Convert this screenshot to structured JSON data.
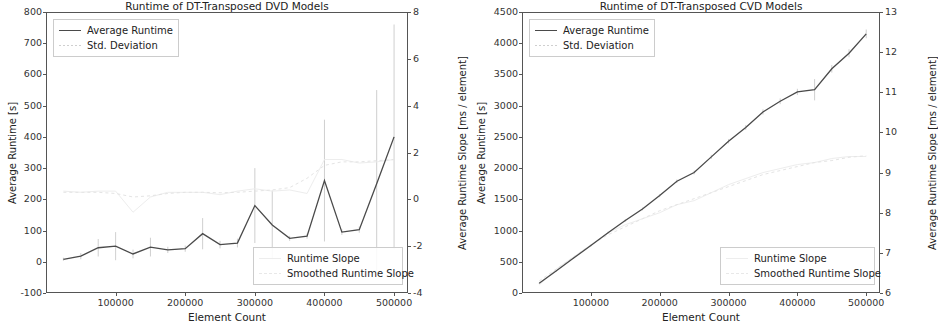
{
  "figure": {
    "panels": [
      {
        "id": "dvd",
        "title": "Runtime of DT-Transposed DVD Models",
        "xlabel": "Element Count",
        "ylabel_left": "Average Runtime [s]",
        "ylabel_right": "Average Runtime Slope [ms / element]",
        "yticks_left": [
          "800",
          "700",
          "600",
          "500",
          "400",
          "300",
          "200",
          "100",
          "0",
          "-100"
        ],
        "yticks_right": [
          "8",
          "6",
          "4",
          "2",
          "0",
          "-2",
          "-4"
        ],
        "xticks": [
          "100000",
          "200000",
          "300000",
          "400000",
          "500000"
        ],
        "legend_top": [
          {
            "label": "Average Runtime",
            "key": "line"
          },
          {
            "label": "Std. Deviation",
            "key": "dot"
          }
        ],
        "legend_bottom": [
          {
            "label": "Runtime Slope",
            "key": "faint1"
          },
          {
            "label": "Smoothed Runtime Slope",
            "key": "faint2"
          }
        ]
      },
      {
        "id": "cvd",
        "title": "Runtime of DT-Transposed CVD Models",
        "xlabel": "Element Count",
        "ylabel_left": "Average Runtime [s]",
        "ylabel_right": "Average Runtime Slope [ms / element]",
        "yticks_left": [
          "4500",
          "4000",
          "3500",
          "3000",
          "2500",
          "2000",
          "1500",
          "1000",
          "500",
          "0"
        ],
        "yticks_right": [
          "13",
          "12",
          "11",
          "10",
          "9",
          "8",
          "7",
          "6"
        ],
        "xticks": [
          "100000",
          "200000",
          "300000",
          "400000",
          "500000"
        ],
        "legend_top": [
          {
            "label": "Average Runtime",
            "key": "line"
          },
          {
            "label": "Std. Deviation",
            "key": "dot"
          }
        ],
        "legend_bottom": [
          {
            "label": "Runtime Slope",
            "key": "faint1"
          },
          {
            "label": "Smoothed Runtime Slope",
            "key": "faint2"
          }
        ]
      }
    ]
  },
  "colors": {
    "runtime_line": "#4a4a4a",
    "std_deviation": "#c9c9c9",
    "slope": "#ededed",
    "smoothed_slope": "#e4e4e4",
    "frame": "#555555",
    "text": "#222222"
  },
  "chart_data": [
    {
      "type": "line",
      "id": "dvd",
      "title": "Runtime of DT-Transposed DVD Models",
      "xlabel": "Element Count",
      "ylabel": "Average Runtime [s]",
      "y2label": "Average Runtime Slope [ms / element]",
      "xlim": [
        0,
        520000
      ],
      "ylim": [
        -100,
        800
      ],
      "y2lim": [
        -4,
        8
      ],
      "xticks": [
        100000,
        200000,
        300000,
        400000,
        500000
      ],
      "yticks": [
        -100,
        0,
        100,
        200,
        300,
        400,
        500,
        600,
        700,
        800
      ],
      "y2ticks": [
        -4,
        -2,
        0,
        2,
        4,
        6,
        8
      ],
      "grid": false,
      "legend_position": [
        "upper left",
        "lower right"
      ],
      "x": [
        25000,
        50000,
        75000,
        100000,
        125000,
        150000,
        175000,
        200000,
        225000,
        250000,
        275000,
        300000,
        325000,
        350000,
        375000,
        400000,
        425000,
        450000,
        475000,
        500000
      ],
      "series": [
        {
          "name": "Average Runtime",
          "values": [
            8,
            18,
            45,
            50,
            25,
            47,
            38,
            42,
            90,
            55,
            60,
            180,
            118,
            75,
            82,
            260,
            95,
            103,
            250,
            400
          ],
          "errors": [
            5,
            10,
            28,
            45,
            14,
            30,
            10,
            10,
            50,
            12,
            14,
            120,
            110,
            8,
            8,
            195,
            9,
            10,
            300,
            360
          ]
        },
        {
          "name": "Runtime Slope",
          "values_y2": [
            0.35,
            0.3,
            0.35,
            0.35,
            -0.55,
            0.1,
            0.3,
            0.3,
            0.3,
            0.2,
            0.35,
            0.45,
            0.35,
            0.4,
            0.25,
            1.7,
            1.7,
            1.55,
            1.6,
            1.7
          ]
        },
        {
          "name": "Smoothed Runtime Slope",
          "values_y2": [
            0.3,
            0.3,
            0.3,
            0.25,
            0.1,
            0.15,
            0.25,
            0.3,
            0.3,
            0.28,
            0.3,
            0.35,
            0.4,
            0.5,
            0.9,
            1.45,
            1.6,
            1.6,
            1.65,
            1.7
          ]
        }
      ]
    },
    {
      "type": "line",
      "id": "cvd",
      "title": "Runtime of DT-Transposed CVD Models",
      "xlabel": "Element Count",
      "ylabel": "Average Runtime [s]",
      "y2label": "Average Runtime Slope [ms / element]",
      "xlim": [
        0,
        520000
      ],
      "ylim": [
        0,
        4500
      ],
      "y2lim": [
        6,
        13
      ],
      "xticks": [
        100000,
        200000,
        300000,
        400000,
        500000
      ],
      "yticks": [
        0,
        500,
        1000,
        1500,
        2000,
        2500,
        3000,
        3500,
        4000,
        4500
      ],
      "y2ticks": [
        6,
        7,
        8,
        9,
        10,
        11,
        12,
        13
      ],
      "grid": false,
      "legend_position": [
        "upper left",
        "lower right"
      ],
      "x": [
        25000,
        50000,
        75000,
        100000,
        125000,
        150000,
        175000,
        200000,
        225000,
        250000,
        275000,
        300000,
        325000,
        350000,
        375000,
        400000,
        425000,
        450000,
        475000,
        500000
      ],
      "series": [
        {
          "name": "Average Runtime",
          "values": [
            155,
            355,
            560,
            760,
            965,
            1160,
            1345,
            1560,
            1790,
            1930,
            2180,
            2430,
            2650,
            2900,
            3070,
            3220,
            3255,
            3590,
            3840,
            4150
          ],
          "errors": [
            10,
            12,
            14,
            16,
            18,
            20,
            22,
            25,
            28,
            30,
            32,
            35,
            38,
            42,
            46,
            50,
            170,
            60,
            64,
            70
          ]
        },
        {
          "name": "Runtime Slope",
          "values_y2": [
            6.2,
            6.6,
            6.9,
            7.2,
            7.5,
            7.7,
            7.85,
            8.0,
            8.2,
            8.3,
            8.5,
            8.7,
            8.85,
            9.0,
            9.1,
            9.2,
            9.25,
            9.35,
            9.4,
            9.4
          ]
        },
        {
          "name": "Smoothed Runtime Slope",
          "values_y2": [
            6.3,
            6.6,
            6.9,
            7.2,
            7.45,
            7.65,
            7.85,
            8.05,
            8.2,
            8.35,
            8.5,
            8.65,
            8.8,
            8.95,
            9.05,
            9.15,
            9.25,
            9.3,
            9.38,
            9.42
          ]
        }
      ]
    }
  ]
}
